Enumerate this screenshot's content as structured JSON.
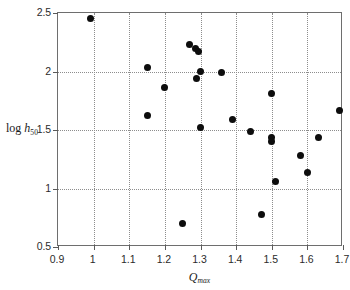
{
  "chart_data": {
    "type": "scatter",
    "title": "",
    "xlabel": "Q_max",
    "ylabel": "log h_50",
    "xlabel_base": "Q",
    "xlabel_sub": "max",
    "ylabel_prefix": "log ",
    "ylabel_base": "h",
    "ylabel_sub": "50",
    "xlim": [
      0.9,
      1.7
    ],
    "ylim": [
      0.5,
      2.5
    ],
    "xticks": [
      0.9,
      1.0,
      1.1,
      1.2,
      1.3,
      1.4,
      1.5,
      1.6,
      1.7
    ],
    "xtick_labels": [
      "0.9",
      "1",
      "1.1",
      "1.2",
      "1.3",
      "1.4",
      "1.5",
      "1.6",
      "1.7"
    ],
    "yticks": [
      0.5,
      1.0,
      1.5,
      2.0,
      2.5
    ],
    "ytick_labels": [
      "0.5",
      "1",
      "1.5",
      "2",
      "2.5"
    ],
    "grid": true,
    "grid_style": "dotted",
    "legend": null,
    "marker": "filled-circle",
    "marker_color": "#0d0d0d",
    "points": [
      {
        "x": 0.99,
        "y": 2.45
      },
      {
        "x": 1.15,
        "y": 2.03
      },
      {
        "x": 1.15,
        "y": 1.62
      },
      {
        "x": 1.2,
        "y": 1.86
      },
      {
        "x": 1.25,
        "y": 0.7
      },
      {
        "x": 1.27,
        "y": 2.23
      },
      {
        "x": 1.285,
        "y": 2.2
      },
      {
        "x": 1.295,
        "y": 2.17
      },
      {
        "x": 1.29,
        "y": 1.94
      },
      {
        "x": 1.3,
        "y": 2.0
      },
      {
        "x": 1.3,
        "y": 1.52
      },
      {
        "x": 1.36,
        "y": 1.99
      },
      {
        "x": 1.39,
        "y": 1.59
      },
      {
        "x": 1.44,
        "y": 1.49
      },
      {
        "x": 1.47,
        "y": 0.78
      },
      {
        "x": 1.5,
        "y": 1.81
      },
      {
        "x": 1.5,
        "y": 1.44
      },
      {
        "x": 1.5,
        "y": 1.4
      },
      {
        "x": 1.51,
        "y": 1.06
      },
      {
        "x": 1.58,
        "y": 1.28
      },
      {
        "x": 1.6,
        "y": 1.14
      },
      {
        "x": 1.63,
        "y": 1.44
      },
      {
        "x": 1.69,
        "y": 1.67
      }
    ]
  }
}
